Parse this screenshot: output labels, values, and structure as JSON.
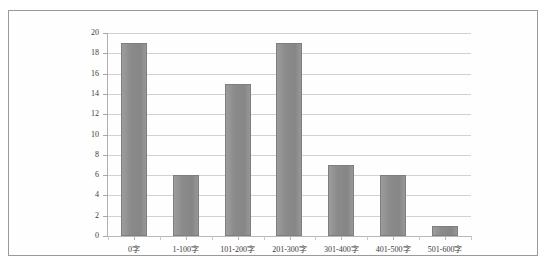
{
  "chart_data": {
    "type": "bar",
    "title": "",
    "subtitle": "",
    "xlabel": "",
    "ylabel": "",
    "categories": [
      "0字",
      "1-100字",
      "101-200字",
      "201-300字",
      "301-400字",
      "401-500字",
      "501-600字"
    ],
    "values": [
      19,
      6,
      15,
      19,
      7,
      6,
      1
    ],
    "series": [
      {
        "name": "",
        "values": [
          19,
          6,
          15,
          19,
          7,
          6,
          1
        ]
      }
    ],
    "ylim": [
      0,
      20
    ],
    "ytick_step": 2,
    "yticks": [
      0,
      2,
      4,
      6,
      8,
      10,
      12,
      14,
      16,
      18,
      20
    ],
    "ytick_labels": [
      "0",
      "2",
      "4",
      "6",
      "8",
      "10",
      "12",
      "14",
      "16",
      "18",
      "20"
    ],
    "grid": "horizontal",
    "legend": "none",
    "bar_color": "#8b8b8b",
    "bar_border_color": "#7e7e7e",
    "gridline_color": "#d2d2d2",
    "axis_color": "#b0b0b0",
    "frame_color": "#9a9a9a",
    "background_color": "#ffffff",
    "annotations": []
  }
}
